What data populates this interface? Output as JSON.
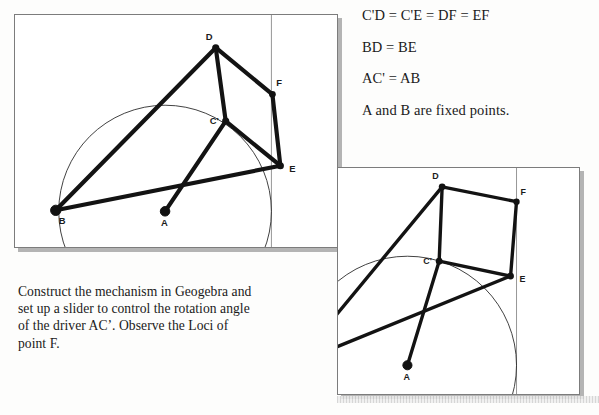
{
  "document": {
    "equations": [
      "C'D = C'E = DF = EF",
      "BD = BE",
      "AC' = AB",
      "A and B are fixed points."
    ],
    "instruction": "Construct the mechanism in Geogebra and set up a slider to control the rotation angle of the driver AC’. Observe the Loci of point F."
  },
  "figure1": {
    "name": "mechanism-diagram-position-1",
    "labels": {
      "A": "A",
      "B": "B",
      "C": "C'",
      "D": "D",
      "E": "E",
      "F": "F"
    },
    "points": {
      "A": [
        166,
        213
      ],
      "B": [
        56,
        212
      ],
      "C": [
        227,
        122
      ],
      "D": [
        217,
        48
      ],
      "E": [
        282,
        167
      ],
      "F": [
        274,
        95
      ]
    },
    "circle": {
      "cx": 166,
      "cy": 213,
      "r": 107
    },
    "vertical_line_x": 273,
    "links": [
      [
        "B",
        "D"
      ],
      [
        "B",
        "E"
      ],
      [
        "D",
        "C"
      ],
      [
        "D",
        "F"
      ],
      [
        "C",
        "E"
      ],
      [
        "E",
        "F"
      ],
      [
        "A",
        "C"
      ]
    ]
  },
  "figure2": {
    "name": "mechanism-diagram-position-2",
    "labels": {
      "A": "A",
      "B": "B",
      "C": "C'",
      "D": "D",
      "E": "E",
      "F": "F"
    },
    "points": {
      "A": [
        408,
        367
      ],
      "B": [
        296,
        365
      ],
      "C": [
        440,
        262
      ],
      "D": [
        443,
        187
      ],
      "E": [
        512,
        277
      ],
      "F": [
        518,
        202
      ]
    },
    "circle": {
      "cx": 408,
      "cy": 367,
      "r": 110
    },
    "vertical_line_x": 518,
    "links": [
      [
        "B",
        "D"
      ],
      [
        "B",
        "E"
      ],
      [
        "D",
        "C"
      ],
      [
        "D",
        "F"
      ],
      [
        "C",
        "E"
      ],
      [
        "E",
        "F"
      ],
      [
        "A",
        "C"
      ]
    ]
  },
  "colors": {
    "frame_border": "#7c7c7c",
    "frame_shadow": "#b4b4b4",
    "link": "#131313",
    "circle": "#2b2b2b",
    "guide_line": "#8a8a8a",
    "text": "#1a1a1a"
  }
}
